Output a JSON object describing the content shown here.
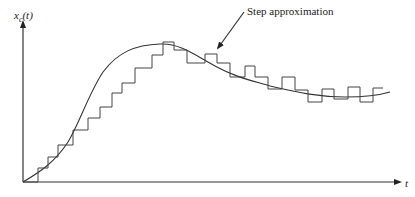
{
  "diagram": {
    "y_axis_label_main": "x",
    "y_axis_label_sub": "c",
    "y_axis_label_arg": "(t)",
    "x_axis_label": "t",
    "annotation": "Step approximation",
    "colors": {
      "line": "#333333",
      "background": "#ffffff"
    },
    "elements": [
      "y-axis with arrow",
      "x-axis with arrow",
      "smooth continuous curve",
      "staircase (zero-order hold) approximation",
      "annotation arrow pointing to staircase"
    ]
  }
}
